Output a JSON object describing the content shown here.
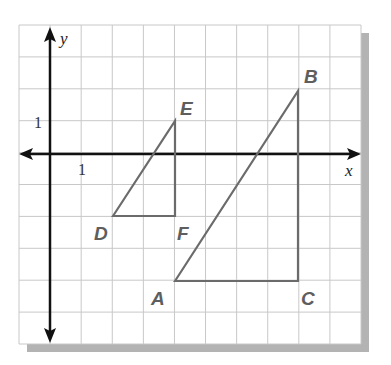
{
  "figure": {
    "type": "coordinate-plane",
    "colors": {
      "background": "#ffffff",
      "grid": "#c8c8c8",
      "axes": "#111111",
      "shape_stroke": "#6b6b6b",
      "vertex_label": "#5e5e5e",
      "shadow": "#b3b3b3"
    },
    "grid": {
      "x_min": -1,
      "x_max": 10,
      "y_min": -6,
      "y_max": 4,
      "step": 1
    },
    "axes": {
      "x_label": "x",
      "y_label": "y",
      "x_tick_label": "1",
      "y_tick_label": "1"
    },
    "triangles": [
      {
        "name": "DEF",
        "vertices": [
          {
            "label": "D",
            "x": 2,
            "y": -2
          },
          {
            "label": "E",
            "x": 4,
            "y": 1
          },
          {
            "label": "F",
            "x": 4,
            "y": -2
          }
        ]
      },
      {
        "name": "ABC",
        "vertices": [
          {
            "label": "A",
            "x": 4,
            "y": -4
          },
          {
            "label": "B",
            "x": 8,
            "y": 2
          },
          {
            "label": "C",
            "x": 8,
            "y": -4
          }
        ]
      }
    ],
    "labels": {
      "D": "D",
      "E": "E",
      "F": "F",
      "A": "A",
      "B": "B",
      "C": "C"
    }
  }
}
